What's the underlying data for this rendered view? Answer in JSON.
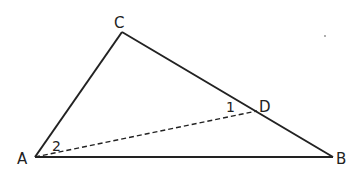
{
  "diagram": {
    "type": "geometry-triangle",
    "points": {
      "A": {
        "label": "A",
        "x": 35,
        "y": 157
      },
      "B": {
        "label": "B",
        "x": 333,
        "y": 157
      },
      "C": {
        "label": "C",
        "x": 122,
        "y": 32
      },
      "D": {
        "label": "D",
        "x": 257,
        "y": 111
      }
    },
    "segments": [
      {
        "from": "A",
        "to": "B",
        "style": "solid"
      },
      {
        "from": "A",
        "to": "C",
        "style": "solid"
      },
      {
        "from": "C",
        "to": "B",
        "style": "solid"
      },
      {
        "from": "A",
        "to": "D",
        "style": "dashed"
      }
    ],
    "angle_labels": [
      {
        "label": "1",
        "at": "D"
      },
      {
        "label": "2",
        "at": "A"
      }
    ],
    "stroke_color": "#222222"
  }
}
